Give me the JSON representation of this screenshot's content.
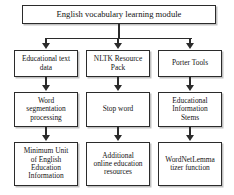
{
  "diagram": {
    "title_node": {
      "label": "English vocabulary learning module"
    },
    "columns": [
      {
        "name": "educational-text-data",
        "nodes": [
          {
            "label": "Educational text\ndata"
          },
          {
            "label": "Word\nsegmentation\nprocessing"
          },
          {
            "label": "Minimum Unit\nof English\nEducation\nInformation"
          }
        ]
      },
      {
        "name": "nltk-resource-pack",
        "nodes": [
          {
            "label": "NLTK Resource\nPack"
          },
          {
            "label": "Stop word"
          },
          {
            "label": "Additional\nonline education\nresources"
          }
        ]
      },
      {
        "name": "porter-tools",
        "nodes": [
          {
            "label": "Porter Tools"
          },
          {
            "label": "Educational\nInformation\nStems"
          },
          {
            "label": "WordNetLemma\ntizer function"
          }
        ]
      }
    ],
    "colors": {
      "stroke": "#2b2b2b",
      "fill": "#ffffff",
      "text": "#141414"
    }
  }
}
